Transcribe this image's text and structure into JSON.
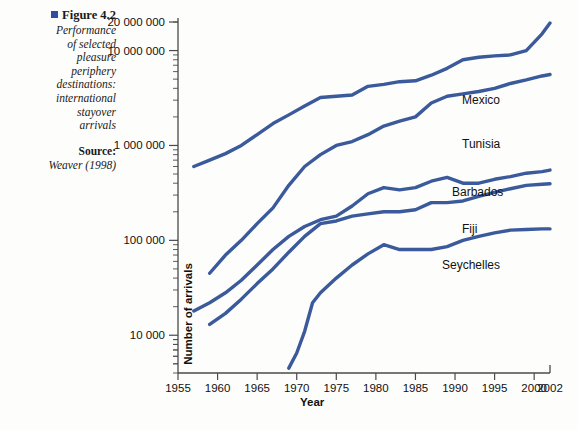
{
  "caption": {
    "figure_number": "Figure 4.2",
    "description": "Performance of selected pleasure periphery destinations: international stayover arrivals",
    "description_lines": [
      "Performance",
      "of selected",
      "pleasure",
      "periphery",
      "destinations:",
      "international",
      "stayover",
      "arrivals"
    ],
    "source_label": "Source:",
    "source_text": "Weaver (1998)"
  },
  "colors": {
    "line": "#3a5a9b",
    "axis": "#4a4a4a",
    "text": "#111111",
    "bullet": "#2e4f9e",
    "background": "#fdfdfb"
  },
  "chart_data": {
    "type": "line",
    "xlabel": "Year",
    "ylabel": "Number of arrivals",
    "yscale": "log",
    "ylim": [
      4000,
      20000000
    ],
    "xlim": [
      1955,
      2002
    ],
    "grid": false,
    "legend_position": "inline-right",
    "y_tick_labels": [
      "10 000",
      "100 000",
      "1 000 000",
      "10 000 000",
      "20 000 000"
    ],
    "y_tick_values": [
      10000,
      100000,
      1000000,
      10000000,
      20000000
    ],
    "x_tick_labels": [
      "1955",
      "1960",
      "1965",
      "1970",
      "1975",
      "1980",
      "1985",
      "1990",
      "1995",
      "2000",
      "2002"
    ],
    "x_tick_values": [
      1955,
      1960,
      1965,
      1970,
      1975,
      1980,
      1985,
      1990,
      1995,
      2000,
      2002
    ],
    "series": [
      {
        "name": "Mexico",
        "label": "Mexico",
        "x": [
          1957,
          1959,
          1961,
          1963,
          1965,
          1967,
          1969,
          1971,
          1973,
          1975,
          1977,
          1979,
          1981,
          1983,
          1985,
          1987,
          1989,
          1991,
          1993,
          1995,
          1997,
          1999,
          2001,
          2002
        ],
        "values": [
          600000,
          700000,
          820000,
          1000000,
          1300000,
          1700000,
          2100000,
          2600000,
          3200000,
          3300000,
          3400000,
          4200000,
          4400000,
          4700000,
          4800000,
          5500000,
          6500000,
          8000000,
          8500000,
          8800000,
          9000000,
          10000000,
          15000000,
          19500000
        ]
      },
      {
        "name": "Tunisia",
        "label": "Tunisia",
        "x": [
          1959,
          1961,
          1963,
          1965,
          1967,
          1969,
          1971,
          1973,
          1975,
          1977,
          1979,
          1981,
          1983,
          1985,
          1987,
          1989,
          1991,
          1993,
          1995,
          1997,
          1999,
          2001,
          2002
        ],
        "values": [
          45000,
          70000,
          100000,
          150000,
          220000,
          380000,
          600000,
          800000,
          1000000,
          1100000,
          1300000,
          1600000,
          1800000,
          2000000,
          2800000,
          3300000,
          3500000,
          3700000,
          4000000,
          4500000,
          4900000,
          5400000,
          5600000
        ]
      },
      {
        "name": "Barbados",
        "label": "Barbados",
        "x": [
          1957,
          1959,
          1961,
          1963,
          1965,
          1967,
          1969,
          1971,
          1973,
          1975,
          1977,
          1979,
          1981,
          1983,
          1985,
          1987,
          1989,
          1991,
          1993,
          1995,
          1997,
          1999,
          2001,
          2002
        ],
        "values": [
          18000,
          22000,
          28000,
          38000,
          55000,
          80000,
          110000,
          140000,
          165000,
          180000,
          230000,
          310000,
          360000,
          340000,
          360000,
          420000,
          460000,
          400000,
          400000,
          440000,
          470000,
          510000,
          530000,
          550000
        ]
      },
      {
        "name": "Fiji",
        "label": "Fiji",
        "x": [
          1959,
          1961,
          1963,
          1965,
          1967,
          1969,
          1971,
          1973,
          1975,
          1977,
          1979,
          1981,
          1983,
          1985,
          1987,
          1989,
          1991,
          1993,
          1995,
          1997,
          1999,
          2001,
          2002
        ],
        "values": [
          13000,
          17000,
          24000,
          35000,
          50000,
          75000,
          110000,
          150000,
          160000,
          180000,
          190000,
          200000,
          200000,
          210000,
          250000,
          250000,
          260000,
          290000,
          320000,
          350000,
          380000,
          390000,
          395000
        ]
      },
      {
        "name": "Seychelles",
        "label": "Seychelles",
        "x": [
          1969,
          1970,
          1971,
          1972,
          1973,
          1975,
          1977,
          1979,
          1981,
          1983,
          1985,
          1987,
          1989,
          1991,
          1993,
          1995,
          1997,
          1999,
          2001,
          2002
        ],
        "values": [
          4500,
          6500,
          11000,
          22000,
          28000,
          40000,
          55000,
          72000,
          90000,
          80000,
          80000,
          80000,
          86000,
          100000,
          110000,
          120000,
          128000,
          130000,
          132000,
          132000
        ]
      }
    ]
  }
}
